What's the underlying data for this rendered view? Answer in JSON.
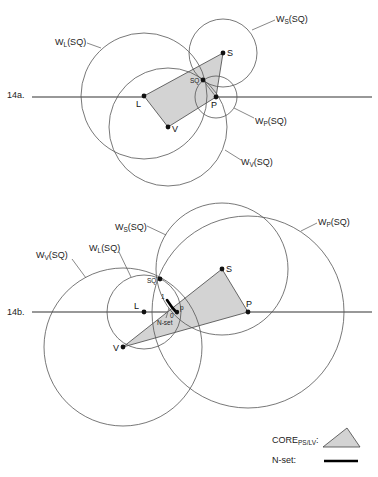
{
  "figure_a": {
    "label": "14a.",
    "points": {
      "L": {
        "label": "L",
        "x": 144,
        "y": 96
      },
      "S": {
        "label": "S",
        "x": 223,
        "y": 53
      },
      "SQ": {
        "label": "SQ",
        "x": 203,
        "y": 80
      },
      "P": {
        "label": "P",
        "x": 216,
        "y": 97
      },
      "V": {
        "label": "V",
        "x": 168,
        "y": 127
      }
    },
    "circles": {
      "WL": {
        "label_main": "W",
        "label_sub": "L",
        "label_tail": "(SQ)",
        "r": 63
      },
      "WS": {
        "label_main": "W",
        "label_sub": "S",
        "label_tail": "(SQ)",
        "r": 34
      },
      "WP": {
        "label_main": "W",
        "label_sub": "P",
        "label_tail": "(SQ)",
        "r": 21
      },
      "WV": {
        "label_main": "W",
        "label_sub": "V",
        "label_tail": "(SQ)",
        "r": 59
      }
    }
  },
  "figure_b": {
    "label": "14b.",
    "points": {
      "L": {
        "label": "L",
        "x": 144,
        "y": 312
      },
      "S": {
        "label": "S",
        "x": 222,
        "y": 269
      },
      "SQ": {
        "label": "SQ",
        "x": 160,
        "y": 279
      },
      "P": {
        "label": "P",
        "x": 248,
        "y": 312
      },
      "V": {
        "label": "V",
        "x": 123,
        "y": 347
      },
      "p": {
        "label": "p",
        "x": 177,
        "y": 312
      }
    },
    "circles": {
      "WV": {
        "label_main": "W",
        "label_sub": "V",
        "label_tail": "(SQ)",
        "r": 79
      },
      "WL": {
        "label_main": "W",
        "label_sub": "L",
        "label_tail": "(SQ)",
        "r": 37
      },
      "WS": {
        "label_main": "W",
        "label_sub": "S",
        "label_tail": "(SQ)",
        "r": 66
      },
      "WP": {
        "label_main": "W",
        "label_sub": "P",
        "label_tail": "(SQ)",
        "r": 96
      }
    },
    "nset_labels": {
      "one": "1",
      "zero": "0",
      "nset": "N-set"
    }
  },
  "legend": {
    "core_main": "CORE",
    "core_sub": "PS/LV",
    "core_colon": ":",
    "nset_label": "N-set:"
  },
  "colors": {
    "core_fill": "#d3d3d3",
    "line": "#333333"
  }
}
